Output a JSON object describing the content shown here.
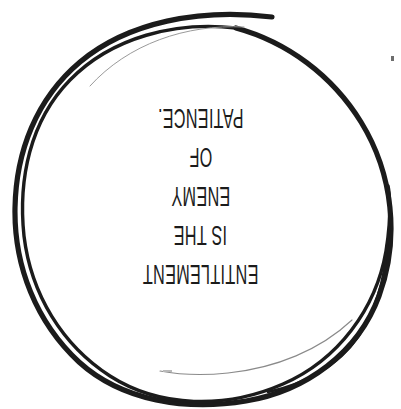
{
  "artwork": {
    "medium": "hand-drawn ink circle on white paper",
    "background_color": "#ffffff",
    "ink_color": "#1b1b1b",
    "circle": {
      "name": "hand-drawn-circle",
      "style": "double-loop scribble with trailing tail on right side",
      "stroke_color": "#1b1b1b",
      "stroke_width_px": 5
    }
  },
  "quote": {
    "orientation": "upside-down",
    "rotation_degrees": 180,
    "full_text": "ENTITLEMENT IS THE ENEMY OF PATIENCE.",
    "lines": [
      "ENTITLEMENT",
      "IS THE",
      "ENEMY",
      "OF",
      "PATIENCE."
    ]
  }
}
